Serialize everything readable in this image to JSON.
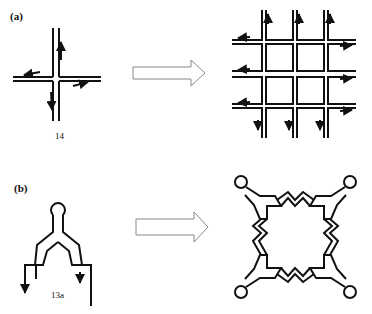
{
  "panels": [
    {
      "label": "(a)",
      "building_block": {
        "name": "14",
        "shape": "cross with four arrowed arms"
      },
      "transformation_arrow": "hollow right arrow",
      "product": {
        "shape": "4x4 square grid network with arrowed edges"
      }
    },
    {
      "label": "(b)",
      "building_block": {
        "name": "13a",
        "shape": "Y-shaped unit with looped top and two arrowed legs"
      },
      "transformation_arrow": "hollow right arrow",
      "product": {
        "shape": "cyclic tetramer (square macrocycle) with four looped corners"
      }
    }
  ],
  "colors": {
    "stroke": "#111111",
    "arrow_outline": "#888888",
    "background": "#ffffff"
  }
}
